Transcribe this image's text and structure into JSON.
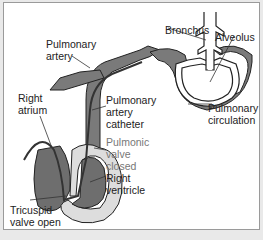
{
  "diagram": {
    "labels": {
      "bronchus": "Bronchus",
      "alveolus": "Alveolus",
      "pulmonary_artery": "Pulmonary\nartery",
      "right_atrium": "Right\natrium",
      "pa_catheter": "Pulmonary\nartery\ncatheter",
      "pulmonic_valve": "Pulmonic\nvalve\nclosed",
      "right_ventricle": "Right\nventricle",
      "pulmonary_circulation": "Pulmonary\ncirculation",
      "tricuspid_valve": "Tricuspid\nvalve open"
    },
    "colors": {
      "tissue": "#7a7a7a",
      "outline": "#222222",
      "background": "#ffffff",
      "label_gray": "#777777"
    }
  }
}
